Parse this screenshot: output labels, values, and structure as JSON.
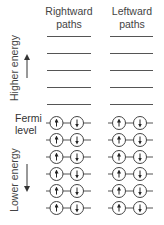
{
  "diagram": {
    "columns": [
      {
        "id": "rightward",
        "title_line1": "Rightward",
        "title_line2": "paths"
      },
      {
        "id": "leftward",
        "title_line1": "Leftward",
        "title_line2": "paths"
      }
    ],
    "axis": {
      "higher_label": "Higher energy",
      "lower_label": "Lower energy",
      "fermi_line1": "Fermi",
      "fermi_line2": "level"
    },
    "empty_levels_per_column": 5,
    "filled_levels_per_column": 6,
    "filled_level_content": [
      "spin-up electron",
      "spin-down electron"
    ],
    "colors": {
      "line": "#555555",
      "text": "#444444",
      "background": "#ffffff"
    }
  }
}
